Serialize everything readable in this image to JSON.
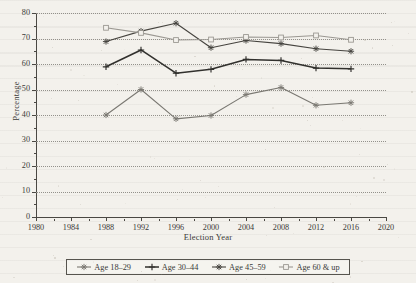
{
  "chart_data": {
    "type": "line",
    "title": "",
    "xlabel": "Election Year",
    "ylabel": "Percentage",
    "xlim": [
      1980,
      2020
    ],
    "ylim": [
      0,
      80
    ],
    "xticks": [
      1980,
      1984,
      1988,
      1992,
      1996,
      2000,
      2004,
      2008,
      2012,
      2016,
      2020
    ],
    "yticks": [
      0,
      10,
      20,
      30,
      40,
      50,
      60,
      70,
      80
    ],
    "x": [
      1988,
      1992,
      1996,
      2000,
      2004,
      2008,
      2012,
      2016
    ],
    "grid": "horizontal-dotted",
    "legend_position": "bottom",
    "series": [
      {
        "name": "Age 18–29",
        "marker": "star",
        "color": "#7a7872",
        "values": [
          40.0,
          50.0,
          38.5,
          39.8,
          48.0,
          50.8,
          43.8,
          44.8
        ]
      },
      {
        "name": "Age 30–44",
        "marker": "plus",
        "color": "#31302d",
        "values": [
          58.9,
          65.5,
          56.4,
          57.9,
          61.8,
          61.4,
          58.4,
          58.1
        ]
      },
      {
        "name": "Age 45–59",
        "marker": "star",
        "color": "#46443f",
        "values": [
          68.8,
          72.9,
          76.0,
          66.4,
          69.2,
          68.0,
          66.0,
          65.0
        ]
      },
      {
        "name": "Age 60 & up",
        "marker": "square",
        "color": "#9b9892",
        "values": [
          74.2,
          72.2,
          69.4,
          69.6,
          70.6,
          70.4,
          71.2,
          69.5
        ]
      }
    ]
  },
  "axis": {
    "ylabel": "Percentage",
    "xlabel": "Election Year"
  },
  "legend": {
    "items": [
      {
        "label": "Age 18–29"
      },
      {
        "label": "Age 30–44"
      },
      {
        "label": "Age 45–59"
      },
      {
        "label": "Age 60 & up"
      }
    ]
  }
}
